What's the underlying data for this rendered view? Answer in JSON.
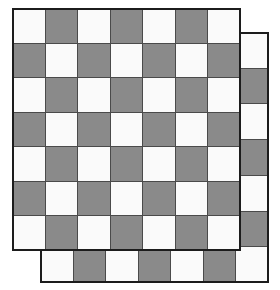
{
  "figure": {
    "canvas": {
      "width": 280,
      "height": 290,
      "background": "#ffffff"
    }
  },
  "palette": {
    "light_square": "#fafafa",
    "dark_square": "#8a8a8a",
    "gridline": "#4a4a4a",
    "outline": "#1c1c1c",
    "background": "#ffffff"
  },
  "chart_data": {
    "type": "heatmap",
    "xlabel": "",
    "ylabel": "",
    "rows": 7,
    "cols": 7,
    "legend": [
      {
        "label": "light square",
        "value": 0,
        "color": "#fafafa"
      },
      {
        "label": "dark square",
        "value": 1,
        "color": "#8a8a8a"
      }
    ],
    "pattern_rule": "cell is light when (row + col) is even, dark when odd; top-left cell is light",
    "boards": [
      {
        "name": "back-board",
        "z_order": 1,
        "x": 40,
        "y": 32,
        "width": 229,
        "height": 251,
        "rows": 7,
        "cols": 7,
        "values": [
          [
            0,
            1,
            0,
            1,
            0,
            1,
            0
          ],
          [
            1,
            0,
            1,
            0,
            1,
            0,
            1
          ],
          [
            0,
            1,
            0,
            1,
            0,
            1,
            0
          ],
          [
            1,
            0,
            1,
            0,
            1,
            0,
            1
          ],
          [
            0,
            1,
            0,
            1,
            0,
            1,
            0
          ],
          [
            1,
            0,
            1,
            0,
            1,
            0,
            1
          ],
          [
            0,
            1,
            0,
            1,
            0,
            1,
            0
          ]
        ]
      },
      {
        "name": "front-board",
        "z_order": 2,
        "x": 12,
        "y": 8,
        "width": 229,
        "height": 243,
        "rows": 7,
        "cols": 7,
        "values": [
          [
            0,
            1,
            0,
            1,
            0,
            1,
            0
          ],
          [
            1,
            0,
            1,
            0,
            1,
            0,
            1
          ],
          [
            0,
            1,
            0,
            1,
            0,
            1,
            0
          ],
          [
            1,
            0,
            1,
            0,
            1,
            0,
            1
          ],
          [
            0,
            1,
            0,
            1,
            0,
            1,
            0
          ],
          [
            1,
            0,
            1,
            0,
            1,
            0,
            1
          ],
          [
            0,
            1,
            0,
            1,
            0,
            1,
            0
          ]
        ]
      }
    ]
  }
}
